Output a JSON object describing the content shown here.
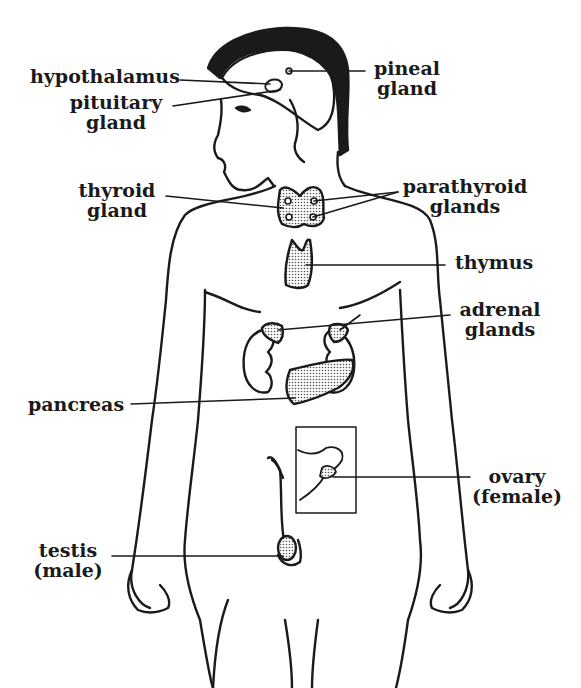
{
  "diagram": {
    "colors": {
      "ink": "#1a1a1a",
      "gland_fill": "#cfcfcf",
      "background": "#ffffff"
    },
    "labels": {
      "hypothalamus": {
        "line1": "hypothalamus"
      },
      "pituitary": {
        "line1": "pituitary",
        "line2": "gland"
      },
      "pineal": {
        "line1": "pineal",
        "line2": "gland"
      },
      "thyroid": {
        "line1": "thyroid",
        "line2": "gland"
      },
      "parathyroid": {
        "line1": "parathyroid",
        "line2": "glands"
      },
      "thymus": {
        "line1": "thymus"
      },
      "adrenal": {
        "line1": "adrenal",
        "line2": "glands"
      },
      "pancreas": {
        "line1": "pancreas"
      },
      "ovary": {
        "line1": "ovary",
        "line2": "(female)"
      },
      "testis": {
        "line1": "testis",
        "line2": "(male)"
      }
    }
  }
}
